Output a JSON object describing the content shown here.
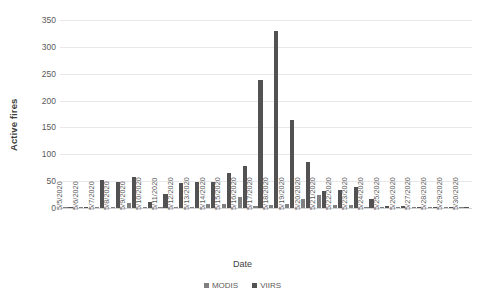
{
  "chart_data": {
    "type": "bar",
    "title": "",
    "subtitle": "",
    "xlabel": "Date",
    "ylabel": "Active fires",
    "ylim": [
      0,
      350
    ],
    "yticks": [
      0,
      50,
      100,
      150,
      200,
      250,
      300,
      350
    ],
    "grid": true,
    "legend_position": "bottom",
    "categories": [
      "5/5/2020",
      "5/6/2020",
      "5/7/2020",
      "5/8/2020",
      "5/9/2020",
      "5/10/2020",
      "5/11/2020",
      "5/12/2020",
      "5/13/2020",
      "5/14/2020",
      "5/15/2020",
      "5/16/2020",
      "5/17/2020",
      "5/18/2020",
      "5/19/2020",
      "5/20/2020",
      "5/21/2020",
      "5/22/2020",
      "5/23/2020",
      "5/24/2020",
      "5/25/2020",
      "5/26/2020",
      "5/27/2020",
      "5/28/2020",
      "5/29/2020",
      "5/30/2020"
    ],
    "series": [
      {
        "name": "MODIS",
        "color": "#808080",
        "values": [
          1,
          0,
          1,
          1,
          10,
          0,
          1,
          1,
          0,
          8,
          8,
          21,
          3,
          6,
          8,
          16,
          24,
          5,
          5,
          1,
          1,
          1,
          1,
          0,
          0,
          0
        ]
      },
      {
        "name": "VIIRS",
        "color": "#525252",
        "values": [
          1,
          1,
          52,
          49,
          57,
          12,
          27,
          47,
          49,
          49,
          65,
          79,
          238,
          330,
          163,
          85,
          32,
          33,
          39,
          16,
          3,
          3,
          1,
          1,
          0,
          0
        ]
      }
    ]
  },
  "legend": {
    "items": [
      {
        "label": "MODIS"
      },
      {
        "label": "VIIRS"
      }
    ]
  }
}
